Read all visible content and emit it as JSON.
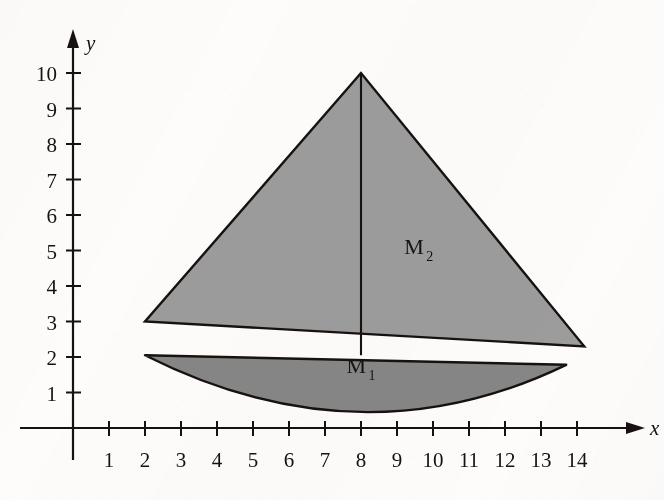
{
  "figure": {
    "kind": "coordinate-plane-region-diagram",
    "background_color": "#fdfcfa",
    "ink_color": "#16120f"
  },
  "axes": {
    "x": {
      "name": "x",
      "ticks": [
        "1",
        "2",
        "3",
        "4",
        "5",
        "6",
        "7",
        "8",
        "9",
        "10",
        "11",
        "12",
        "13",
        "14"
      ],
      "min": 0,
      "max": 15.2,
      "arrow": true
    },
    "y": {
      "name": "y",
      "ticks": [
        "1",
        "2",
        "3",
        "4",
        "5",
        "6",
        "7",
        "8",
        "9",
        "10"
      ],
      "min": 0,
      "max": 11.2,
      "arrow": true
    },
    "origin_px": [
      73,
      428
    ],
    "unit_px": [
      36.0,
      35.5
    ]
  },
  "chart_data": {
    "type": "area",
    "title": "",
    "xlabel": "x",
    "ylabel": "y",
    "xlim": [
      0,
      15.2
    ],
    "ylim": [
      0,
      11.2
    ],
    "grid": false,
    "legend": "none",
    "xticks": [
      1,
      2,
      3,
      4,
      5,
      6,
      7,
      8,
      9,
      10,
      11,
      12,
      13,
      14
    ],
    "yticks": [
      1,
      2,
      3,
      4,
      5,
      6,
      7,
      8,
      9,
      10
    ],
    "regions": [
      {
        "name": "M_2",
        "label": "M",
        "label_sub": "2",
        "shape": "triangle",
        "fill": "#9c9c9c",
        "stroke": "#17120f",
        "vertices": [
          [
            8,
            10
          ],
          [
            2,
            3
          ],
          [
            14.2,
            2.3
          ]
        ],
        "label_xy": [
          9.2,
          4.9
        ]
      },
      {
        "name": "M_1",
        "label": "M",
        "label_sub": "1",
        "shape": "parabolic-lens",
        "fill": "#868686",
        "stroke": "#17120f",
        "left_tip": [
          2,
          2.05
        ],
        "right_tip": [
          13.7,
          1.78
        ],
        "lowest_point": [
          8,
          0.45
        ],
        "label_xy": [
          7.6,
          1.55
        ]
      }
    ],
    "annotations": [
      {
        "name": "median-segment",
        "type": "line",
        "from": [
          8,
          10
        ],
        "to": [
          8,
          2.05
        ],
        "stroke": "#17120f"
      }
    ]
  },
  "labels": {
    "m2_main": "M",
    "m2_sub": "2",
    "m1_main": "M",
    "m1_sub": "1"
  }
}
